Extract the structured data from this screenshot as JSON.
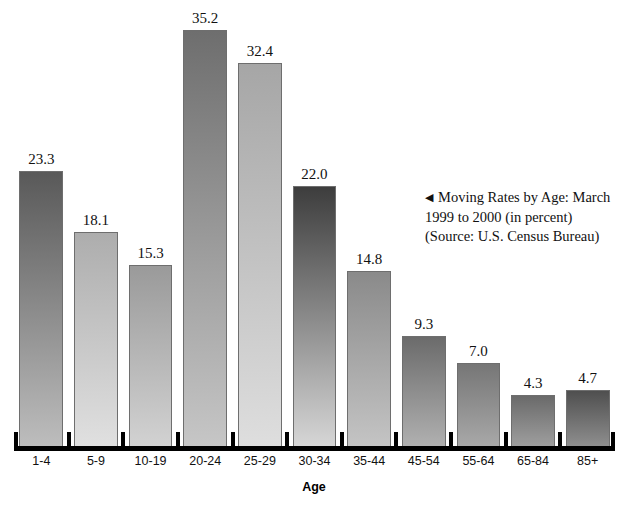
{
  "chart_data": {
    "type": "bar",
    "title": "",
    "xlabel": "Age",
    "ylabel": "",
    "ylim": [
      0,
      35.2
    ],
    "grid": false,
    "legend": null,
    "categories": [
      "1-4",
      "5-9",
      "10-19",
      "20-24",
      "25-29",
      "30-34",
      "35-44",
      "45-54",
      "55-64",
      "65-84",
      "85+"
    ],
    "values": [
      23.3,
      18.1,
      15.3,
      35.2,
      32.4,
      22.0,
      14.8,
      9.3,
      7.0,
      4.3,
      4.7
    ],
    "value_labels": [
      "23.3",
      "18.1",
      "15.3",
      "35.2",
      "32.4",
      "22.0",
      "14.8",
      "9.3",
      "7.0",
      "4.3",
      "4.7"
    ],
    "bar_shading": [
      {
        "top": "#595959",
        "bottom": "#bdbdbd"
      },
      {
        "top": "#adadad",
        "bottom": "#e0e0e0"
      },
      {
        "top": "#9a9a9a",
        "bottom": "#d2d2d2"
      },
      {
        "top": "#6e6e6e",
        "bottom": "#c6c6c6"
      },
      {
        "top": "#a6a6a6",
        "bottom": "#dedede"
      },
      {
        "top": "#3d3d3d",
        "bottom": "#d6d6d6"
      },
      {
        "top": "#8a8a8a",
        "bottom": "#c4c4c4"
      },
      {
        "top": "#6b6b6b",
        "bottom": "#b0b0b0"
      },
      {
        "top": "#767676",
        "bottom": "#a8a8a8"
      },
      {
        "top": "#6a6a6a",
        "bottom": "#9e9e9e"
      },
      {
        "top": "#4f4f4f",
        "bottom": "#8e8e8e"
      }
    ],
    "annotations": [
      "Moving Rates by Age: March 1999 to 2000 (in percent)",
      "(Source: U.S. Census Bureau)"
    ]
  },
  "caption": {
    "arrow": "◀",
    "line1": "Moving Rates by Age: March",
    "line2": "1999 to 2000 (in percent)",
    "line3": "(Source: U.S. Census Bureau)"
  },
  "axis": {
    "title": "Age"
  }
}
